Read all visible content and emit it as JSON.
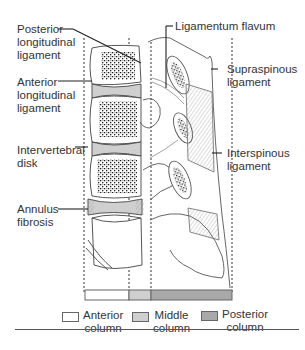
{
  "diagram": {
    "labels": {
      "posterior_longitudinal_ligament": "Posterior\nlongitudinal\nligament",
      "anterior_longitudinal_ligament": "Anterior\nlongitudinal\nligament",
      "intervertebral_disk": "Intervertebral\ndisk",
      "annulus_fibrosis": "Annulus\nfibrosis",
      "ligamentum_flavum": "Ligamentum flavum",
      "supraspinous_ligament": "Supraspinous\nligament",
      "interspinous_ligament": "Interspinous\nligament"
    },
    "legend": [
      {
        "label": "Anterior\ncolumn",
        "color": "#ffffff"
      },
      {
        "label": "Middle\ncolumn",
        "color": "#cfcfcf"
      },
      {
        "label": "Posterior\ncolumn",
        "color": "#a9a9a9"
      }
    ]
  }
}
